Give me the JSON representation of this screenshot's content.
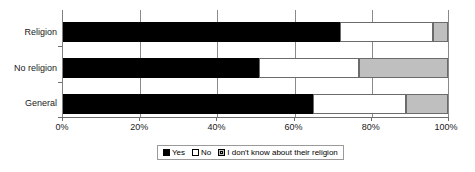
{
  "chart_data": {
    "type": "bar",
    "orientation": "horizontal",
    "stacked": true,
    "stacked_percent": true,
    "title": "",
    "xlabel": "",
    "ylabel": "",
    "xlim": [
      0,
      100
    ],
    "grid": true,
    "legend_position": "bottom",
    "categories": [
      "Religion",
      "No religion",
      "General"
    ],
    "xticks": [
      "0%",
      "20%",
      "40%",
      "60%",
      "80%",
      "100%"
    ],
    "xtick_values": [
      0,
      20,
      40,
      60,
      80,
      100
    ],
    "series": [
      {
        "name": "Yes",
        "color": "#000000",
        "values": [
          72,
          51,
          65
        ]
      },
      {
        "name": "No",
        "color": "#ffffff",
        "values": [
          24,
          26,
          24
        ]
      },
      {
        "name": "I don't know about their religion",
        "color": "#bfbfbf",
        "values": [
          4,
          23,
          11
        ]
      }
    ]
  },
  "legend": {
    "items": [
      {
        "label": "Yes",
        "swatch": "black-square-icon"
      },
      {
        "label": "No",
        "swatch": "white-square-icon"
      },
      {
        "label": "I don't know about their religion",
        "swatch": "gray-square-icon"
      }
    ]
  },
  "axis": {
    "y_labels": [
      "Religion",
      "No religion",
      "General"
    ],
    "x_labels": [
      "0%",
      "20%",
      "40%",
      "60%",
      "80%",
      "100%"
    ]
  },
  "colors": {
    "yes": "#000000",
    "no": "#ffffff",
    "dont_know": "#bfbfbf",
    "grid": "#8a8a8a",
    "axis": "#6e6e6e",
    "background": "#ffffff"
  }
}
